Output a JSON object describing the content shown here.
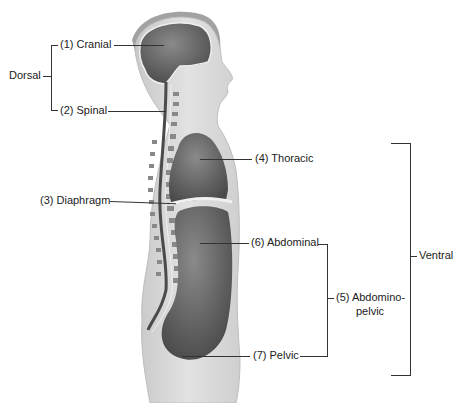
{
  "diagram": {
    "colors": {
      "skin": "#d9d9d9",
      "skin_edge": "#bdbdbd",
      "hair": "#9a9a9a",
      "cavity": "#5a5a5a",
      "cavity_highlight": "#8a8a8a",
      "lines": "#333333",
      "text": "#222222"
    },
    "groups": {
      "dorsal": "Dorsal",
      "ventral": "Ventral"
    },
    "labels": {
      "cranial": "(1) Cranial",
      "spinal": "(2) Spinal",
      "diaphragm": "(3) Diaphragm",
      "thoracic": "(4) Thoracic",
      "abdominopelvic_1": "(5) Abdomino-",
      "abdominopelvic_2": "pelvic",
      "abdominal": "(6) Abdominal",
      "pelvic": "(7) Pelvic"
    }
  }
}
